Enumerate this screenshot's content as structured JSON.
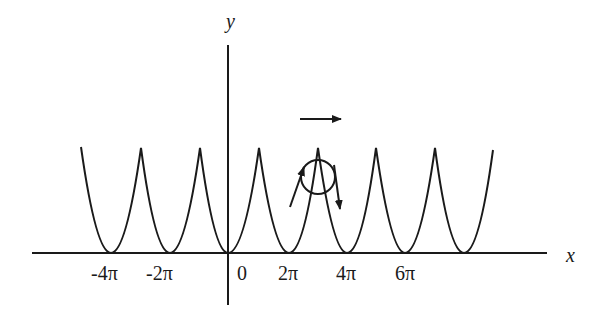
{
  "diagram": {
    "axes": {
      "x_label": "x",
      "y_label": "y"
    },
    "tick_labels": [
      {
        "text": "-4π",
        "x": 105
      },
      {
        "text": "-2π",
        "x": 163
      },
      {
        "text": "0",
        "x": 242
      },
      {
        "text": "2π",
        "x": 298
      },
      {
        "text": "4π",
        "x": 351
      },
      {
        "text": "6π",
        "x": 409
      }
    ],
    "curve": {
      "description": "periodic cusped parabolic arcs (cycloid-like) with minima at multiples of 2π",
      "minima_x": [
        111,
        170,
        228,
        289,
        347,
        405,
        464
      ],
      "peaks_x": [
        141,
        200,
        259,
        318,
        376,
        435
      ],
      "baseline_y": 253,
      "peak_y": 148
    },
    "ball": {
      "shape": "circle",
      "center": [
        318,
        177
      ],
      "radius": 17
    },
    "arrows": [
      {
        "name": "velocity-right-arrow",
        "from": [
          300,
          119
        ],
        "to": [
          341,
          119
        ]
      },
      {
        "name": "up-slope-arrow",
        "from": [
          290,
          207
        ],
        "to": [
          304,
          167
        ]
      },
      {
        "name": "down-slope-arrow",
        "from": [
          334,
          165
        ],
        "to": [
          340,
          209
        ]
      }
    ],
    "colors": {
      "stroke": "#1a1a1a",
      "background": "#ffffff"
    }
  }
}
